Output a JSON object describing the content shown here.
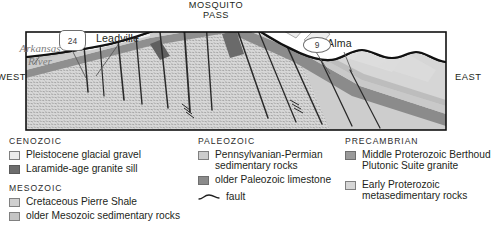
{
  "figure": {
    "orientation_labels": {
      "west": "WEST",
      "east": "EAST"
    }
  },
  "section_labels": {
    "pass": "MOSQUITO\nPASS",
    "pass_line1": "MOSQUITO",
    "pass_line2": "PASS",
    "leadville": "Leadville",
    "alma": "Alma",
    "river_line1": "Arkansas",
    "river_line2": "River",
    "highway_us": "24",
    "highway_state": "9"
  },
  "legend": {
    "columns": [
      {
        "id": "column-left",
        "groups": [
          {
            "era": "CENOZOIC",
            "items": [
              {
                "label": "Pleistocene glacial gravel",
                "swatch": "c-gravel",
                "color": "#ededed"
              },
              {
                "label": "Laramide-age granite sill",
                "swatch": "c-sill",
                "color": "#6d6d6d"
              }
            ]
          },
          {
            "era": "MESOZOIC",
            "items": [
              {
                "label": "Cretaceous Pierre Shale",
                "swatch": "c-pierre",
                "color": "#cfcfcf"
              },
              {
                "label": "older Mesozoic sedimentary rocks",
                "swatch": "c-mesoz",
                "color": "#c4c4c4"
              }
            ]
          }
        ]
      },
      {
        "id": "column-middle",
        "groups": [
          {
            "era": "PALEOZOIC",
            "items": [
              {
                "label": "Pennsylvanian-Permian sedimentary rocks",
                "swatch": "c-pennperm",
                "color": "#cccccc"
              },
              {
                "label": "older Paleozoic limestone",
                "swatch": "c-paleolime",
                "color": "#8b8b8b"
              }
            ]
          }
        ],
        "symbol": {
          "label": "fault",
          "icon": "fault-line-symbol"
        }
      },
      {
        "id": "column-right",
        "groups": [
          {
            "era": "PRECAMBRIAN",
            "items": [
              {
                "label": "Middle Proterozoic Berthoud Plutonic Suite granite",
                "swatch": "c-berthoud",
                "color": "#9a9a9a"
              },
              {
                "label": "Early Proterozoic metasedimentary rocks",
                "swatch": "c-earlyprot",
                "color": "#d6d6d6"
              }
            ]
          }
        ]
      }
    ]
  },
  "colors": {
    "ink": "#231f20",
    "river_text": "#7d7d7d",
    "outline": "#1a1a1a",
    "gravel": "#ededed",
    "pierre_shale": "#cfcfcf",
    "mesozoic": "#c4c4c4",
    "penn_permian": "#cccccc",
    "paleozoic_limestone": "#8b8b8b",
    "granite_sill": "#6d6d6d",
    "berthoud_granite": "#9a9a9a",
    "early_proterozoic": "#d6d6d6"
  }
}
